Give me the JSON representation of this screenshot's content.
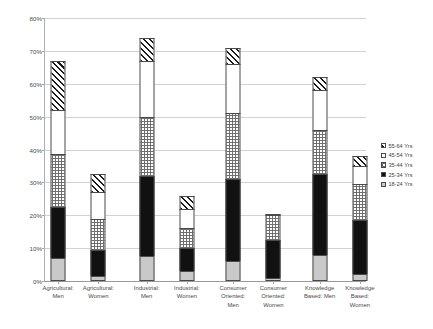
{
  "chart_data": {
    "type": "bar",
    "subtype": "stacked-vertical",
    "title": "",
    "xlabel": "",
    "ylabel": "Proportion Business Creation",
    "ylim": [
      0,
      80
    ],
    "ytick_labels": [
      "0%",
      "10%",
      "20%",
      "30%",
      "40%",
      "50%",
      "60%",
      "70%",
      "80%"
    ],
    "ytick_values": [
      0,
      10,
      20,
      30,
      40,
      50,
      60,
      70,
      80
    ],
    "grid": true,
    "legend_position": "right",
    "categories": [
      "Agricultural: Men",
      "Agricultural: Women",
      "Industrial: Men",
      "Industrial: Women",
      "Consumer Oriented: Men",
      "Consumer Oriented: Women",
      "Knowledge Based: Men",
      "Knowledge Based: Women"
    ],
    "category_lines": [
      [
        "Agricultural:",
        "Men"
      ],
      [
        "Agricultural:",
        "Women"
      ],
      [
        "Industrial:",
        "Men"
      ],
      [
        "Industrial:",
        "Women"
      ],
      [
        "Consumer",
        "Oriented:",
        "Men"
      ],
      [
        "Consumer",
        "Oriented:",
        "Women"
      ],
      [
        "Knowledge",
        "Based: Men"
      ],
      [
        "Knowledge",
        "Based:",
        "Women"
      ]
    ],
    "series": [
      {
        "name": "18-24 Yrs",
        "pattern": "light-gray-solid",
        "values": [
          7.0,
          1.5,
          7.5,
          3.0,
          6.0,
          1.0,
          8.0,
          2.0
        ]
      },
      {
        "name": "25-34 Yrs",
        "pattern": "black-solid",
        "values": [
          15.5,
          8.0,
          24.5,
          7.0,
          25.0,
          11.5,
          24.5,
          16.5
        ]
      },
      {
        "name": "35-44 Yrs",
        "pattern": "checkered",
        "values": [
          16.0,
          9.5,
          18.0,
          6.0,
          20.0,
          7.5,
          13.5,
          11.0
        ]
      },
      {
        "name": "45-54 Yrs",
        "pattern": "white-empty",
        "values": [
          13.5,
          8.0,
          17.0,
          6.0,
          15.0,
          0.5,
          12.0,
          5.5
        ]
      },
      {
        "name": "55-64 Yrs",
        "pattern": "diagonal-hatch",
        "values": [
          15.0,
          5.5,
          7.0,
          4.0,
          5.0,
          0.0,
          4.0,
          3.0
        ]
      }
    ],
    "totals": [
      67.0,
      32.5,
      74.0,
      26.0,
      71.0,
      20.5,
      62.0,
      38.0
    ],
    "legend_entries": [
      {
        "label": "55-64 Yrs",
        "pattern": "diagonal-hatch"
      },
      {
        "label": "45-54 Yrs",
        "pattern": "white-empty"
      },
      {
        "label": "35-44 Yrs",
        "pattern": "checkered"
      },
      {
        "label": "25-34 Yrs",
        "pattern": "black-solid"
      },
      {
        "label": "18-24 Yrs",
        "pattern": "light-gray-solid"
      }
    ],
    "colors": {
      "grid": "#d2d2d2",
      "axis": "#9a9a9a",
      "text": "#4a4a4a",
      "black_segment": "#111111",
      "gray_segment": "#c9c9c9",
      "segment_outline": "#4a4a4a"
    }
  }
}
